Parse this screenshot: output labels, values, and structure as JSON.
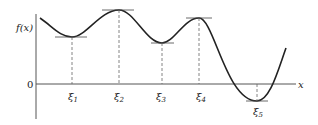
{
  "diagram": {
    "y_label": "f(x)",
    "x_label": "x",
    "origin_label": "0",
    "points": [
      {
        "label": "ξ1",
        "sub": "1",
        "kind": "local minimum"
      },
      {
        "label": "ξ2",
        "sub": "2",
        "kind": "local maximum"
      },
      {
        "label": "ξ3",
        "sub": "3",
        "kind": "local minimum"
      },
      {
        "label": "ξ4",
        "sub": "4",
        "kind": "local maximum"
      },
      {
        "label": "ξ5",
        "sub": "5",
        "kind": "local minimum"
      }
    ],
    "colors": {
      "curve": "#222222",
      "axis": "#555555",
      "dashed": "#666666"
    }
  }
}
